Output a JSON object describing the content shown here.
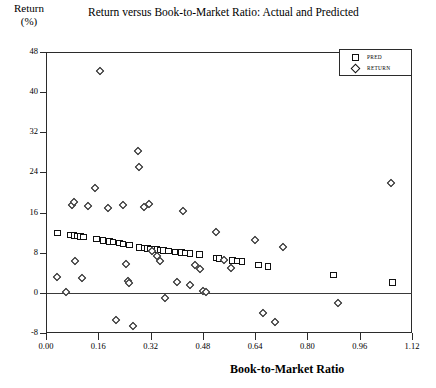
{
  "chart_data": {
    "type": "scatter",
    "title": "Return versus Book-to-Market Ratio: Actual and Predicted",
    "ylabel_line1": "Return",
    "ylabel_line2": "(%)",
    "xlabel": "Book-to-Market Ratio",
    "xlim": [
      0.0,
      1.12
    ],
    "ylim": [
      -8,
      48
    ],
    "xticks": [
      "0.00",
      "0.16",
      "0.32",
      "0.48",
      "0.64",
      "0.80",
      "0.96",
      "1.12"
    ],
    "xtick_values": [
      0.0,
      0.16,
      0.32,
      0.48,
      0.64,
      0.8,
      0.96,
      1.12
    ],
    "yticks": [
      "48",
      "40",
      "32",
      "24",
      "16",
      "8",
      "0",
      "-8"
    ],
    "ytick_values": [
      48,
      40,
      32,
      24,
      16,
      8,
      0,
      -8
    ],
    "grid": false,
    "zero_line": true,
    "legend_position": "top-right",
    "legend": [
      {
        "label": "PRED",
        "marker": "square"
      },
      {
        "label": "RETURN",
        "marker": "diamond"
      }
    ],
    "series": [
      {
        "name": "PRED",
        "marker": "square",
        "points": [
          [
            0.035,
            11.9
          ],
          [
            0.075,
            11.5
          ],
          [
            0.085,
            11.4
          ],
          [
            0.095,
            11.3
          ],
          [
            0.105,
            11.2
          ],
          [
            0.115,
            11.1
          ],
          [
            0.155,
            10.7
          ],
          [
            0.175,
            10.4
          ],
          [
            0.195,
            10.2
          ],
          [
            0.205,
            10.1
          ],
          [
            0.225,
            9.9
          ],
          [
            0.235,
            9.7
          ],
          [
            0.255,
            9.5
          ],
          [
            0.285,
            9.0
          ],
          [
            0.3,
            8.9
          ],
          [
            0.31,
            8.8
          ],
          [
            0.32,
            8.7
          ],
          [
            0.33,
            8.7
          ],
          [
            0.34,
            8.6
          ],
          [
            0.35,
            8.5
          ],
          [
            0.36,
            8.4
          ],
          [
            0.375,
            8.3
          ],
          [
            0.395,
            8.1
          ],
          [
            0.415,
            8.0
          ],
          [
            0.425,
            7.9
          ],
          [
            0.44,
            7.8
          ],
          [
            0.47,
            7.6
          ],
          [
            0.52,
            6.9
          ],
          [
            0.53,
            6.8
          ],
          [
            0.57,
            6.4
          ],
          [
            0.585,
            6.3
          ],
          [
            0.6,
            6.2
          ],
          [
            0.65,
            5.6
          ],
          [
            0.68,
            5.3
          ],
          [
            0.88,
            3.6
          ],
          [
            1.06,
            2.1
          ]
        ]
      },
      {
        "name": "RETURN",
        "marker": "diamond",
        "points": [
          [
            0.035,
            3.2
          ],
          [
            0.06,
            0.1
          ],
          [
            0.08,
            17.6
          ],
          [
            0.085,
            18.2
          ],
          [
            0.09,
            6.3
          ],
          [
            0.11,
            3.0
          ],
          [
            0.13,
            17.3
          ],
          [
            0.15,
            20.8
          ],
          [
            0.165,
            44.2
          ],
          [
            0.19,
            16.9
          ],
          [
            0.215,
            -5.5
          ],
          [
            0.235,
            17.6
          ],
          [
            0.245,
            5.8
          ],
          [
            0.25,
            2.3
          ],
          [
            0.255,
            1.9
          ],
          [
            0.265,
            -6.6
          ],
          [
            0.28,
            28.3
          ],
          [
            0.285,
            25.1
          ],
          [
            0.3,
            17.2
          ],
          [
            0.315,
            17.8
          ],
          [
            0.325,
            8.3
          ],
          [
            0.34,
            7.3
          ],
          [
            0.35,
            6.4
          ],
          [
            0.365,
            -1.0
          ],
          [
            0.4,
            2.1
          ],
          [
            0.42,
            16.3
          ],
          [
            0.44,
            1.6
          ],
          [
            0.455,
            5.6
          ],
          [
            0.47,
            4.7
          ],
          [
            0.48,
            0.3
          ],
          [
            0.49,
            0.2
          ],
          [
            0.52,
            12.2
          ],
          [
            0.545,
            6.6
          ],
          [
            0.565,
            4.9
          ],
          [
            0.64,
            10.6
          ],
          [
            0.665,
            -4.1
          ],
          [
            0.7,
            -5.9
          ],
          [
            0.725,
            9.2
          ],
          [
            0.895,
            -2.1
          ],
          [
            1.055,
            21.9
          ]
        ]
      }
    ]
  }
}
